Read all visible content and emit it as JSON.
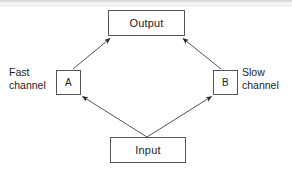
{
  "diagram": {
    "stroke_color": "#555555",
    "text_color": "#1d1d1d",
    "background_color": "#ffffff",
    "nodes": {
      "output": {
        "label": "Output"
      },
      "input": {
        "label": "Input"
      },
      "a": {
        "label": "A"
      },
      "b": {
        "label": "B"
      }
    },
    "labels": {
      "fast_channel": "Fast\nchannel",
      "slow_channel": "Slow\nchannel"
    },
    "edges": [
      {
        "from": "input",
        "to": "a",
        "arrow": "to"
      },
      {
        "from": "input",
        "to": "b",
        "arrow": "to"
      },
      {
        "from": "a",
        "to": "output",
        "arrow": "to"
      },
      {
        "from": "b",
        "to": "output",
        "arrow": "to"
      }
    ]
  }
}
